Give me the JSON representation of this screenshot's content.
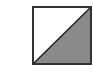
{
  "shape": {
    "name": "half-filled-square",
    "fill_color": "#8a8a8a",
    "background_color": "#ffffff",
    "border_color": "#333333",
    "diagonal": "bottom-left to top-right"
  }
}
